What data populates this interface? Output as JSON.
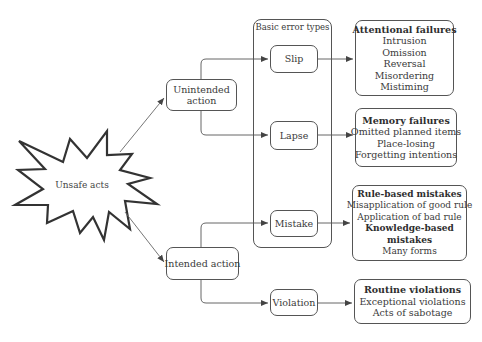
{
  "diagram": {
    "root": {
      "label": "Unsafe acts",
      "shape": "starburst"
    },
    "actions": [
      {
        "id": "unintended",
        "label_lines": [
          "Unintended",
          "action"
        ]
      },
      {
        "id": "intended",
        "label_lines": [
          "Intended action"
        ]
      }
    ],
    "group": {
      "title": "Basic error types",
      "members": [
        "slip",
        "lapse",
        "mistake"
      ]
    },
    "error_types": [
      {
        "id": "slip",
        "label": "Slip",
        "parent": "unintended"
      },
      {
        "id": "lapse",
        "label": "Lapse",
        "parent": "unintended"
      },
      {
        "id": "mistake",
        "label": "Mistake",
        "parent": "intended"
      },
      {
        "id": "violation",
        "label": "Violation",
        "parent": "intended"
      }
    ],
    "outcomes": [
      {
        "source": "slip",
        "lines": [
          {
            "text": "Attentional failures",
            "bold": true
          },
          {
            "text": "Intrusion",
            "bold": false
          },
          {
            "text": "Omission",
            "bold": false
          },
          {
            "text": "Reversal",
            "bold": false
          },
          {
            "text": "Misordering",
            "bold": false
          },
          {
            "text": "Mistiming",
            "bold": false
          }
        ]
      },
      {
        "source": "lapse",
        "lines": [
          {
            "text": "Memory failures",
            "bold": true
          },
          {
            "text": "Omitted planned items",
            "bold": false
          },
          {
            "text": "Place-losing",
            "bold": false
          },
          {
            "text": "Forgetting intentions",
            "bold": false
          }
        ]
      },
      {
        "source": "mistake",
        "lines": [
          {
            "text": "Rule-based mistakes",
            "bold": true
          },
          {
            "text": "Misapplication of good rule",
            "bold": false
          },
          {
            "text": "Application of bad rule",
            "bold": false
          },
          {
            "text": "Knowledge-based",
            "bold": true
          },
          {
            "text": "mistakes",
            "bold": true
          },
          {
            "text": "Many forms",
            "bold": false
          }
        ]
      },
      {
        "source": "violation",
        "lines": [
          {
            "text": "Routine violations",
            "bold": true
          },
          {
            "text": "Exceptional violations",
            "bold": false
          },
          {
            "text": "Acts of sabotage",
            "bold": false
          }
        ]
      }
    ],
    "colors": {
      "stroke": "#555555",
      "burst_stroke": "#333333",
      "text": "#3a3a3a"
    }
  }
}
